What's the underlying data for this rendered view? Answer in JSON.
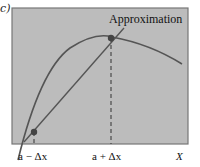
{
  "panel": {
    "label": "c)"
  },
  "diagram": {
    "annotation": "Approximation",
    "x_axis_label": "X",
    "tick_labels": [
      "a − Δx",
      "a + Δx"
    ],
    "background_color": "#bdbdbd",
    "curve_color": "#555555",
    "point_color": "#444444"
  }
}
